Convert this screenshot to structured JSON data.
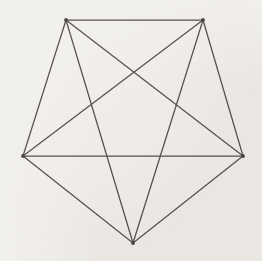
{
  "figure": {
    "background_color": "#f2f0ed",
    "edge_color": "#55524f",
    "vertex_color": "#4a4744",
    "edge_width": 1.25,
    "canvas": {
      "width": 262,
      "height": 261
    },
    "vertex_count": 5,
    "edge_count": 10,
    "vertices": [
      {
        "id": "top-left",
        "label": "A",
        "x": 66,
        "y": 20
      },
      {
        "id": "top-right",
        "label": "B",
        "x": 203,
        "y": 20
      },
      {
        "id": "right",
        "label": "C",
        "x": 243,
        "y": 156
      },
      {
        "id": "bottom",
        "label": "D",
        "x": 133,
        "y": 243
      },
      {
        "id": "left",
        "label": "E",
        "x": 23,
        "y": 156
      }
    ],
    "edges": [
      {
        "id": "edge-A-B",
        "from": "top-left",
        "to": "top-right",
        "x1": 66,
        "y1": 20,
        "x2": 203,
        "y2": 20
      },
      {
        "id": "edge-B-C",
        "from": "top-right",
        "to": "right",
        "x1": 203,
        "y1": 20,
        "x2": 243,
        "y2": 156
      },
      {
        "id": "edge-C-D",
        "from": "right",
        "to": "bottom",
        "x1": 243,
        "y1": 156,
        "x2": 133,
        "y2": 243
      },
      {
        "id": "edge-D-E",
        "from": "bottom",
        "to": "left",
        "x1": 133,
        "y1": 243,
        "x2": 23,
        "y2": 156
      },
      {
        "id": "edge-E-A",
        "from": "left",
        "to": "top-left",
        "x1": 23,
        "y1": 156,
        "x2": 66,
        "y2": 20
      },
      {
        "id": "edge-A-C",
        "from": "top-left",
        "to": "right",
        "x1": 66,
        "y1": 20,
        "x2": 243,
        "y2": 156
      },
      {
        "id": "edge-A-D",
        "from": "top-left",
        "to": "bottom",
        "x1": 66,
        "y1": 20,
        "x2": 133,
        "y2": 243
      },
      {
        "id": "edge-B-D",
        "from": "top-right",
        "to": "bottom",
        "x1": 203,
        "y1": 20,
        "x2": 133,
        "y2": 243
      },
      {
        "id": "edge-B-E",
        "from": "top-right",
        "to": "left",
        "x1": 203,
        "y1": 20,
        "x2": 23,
        "y2": 156
      },
      {
        "id": "edge-C-E",
        "from": "right",
        "to": "left",
        "x1": 243,
        "y1": 156,
        "x2": 23,
        "y2": 156
      }
    ]
  }
}
